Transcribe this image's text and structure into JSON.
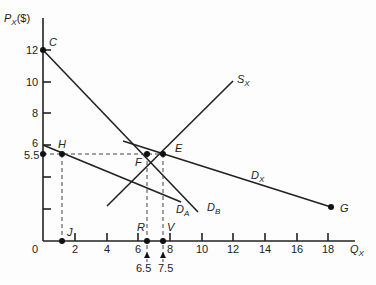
{
  "diagram": {
    "type": "supply-demand",
    "y_axis": {
      "label": "P",
      "label_sub": "X",
      "label_unit": "($)",
      "ticks": [
        "12",
        "10",
        "8",
        "6",
        "5.5"
      ]
    },
    "x_axis": {
      "label": "Q",
      "label_sub": "X",
      "ticks": [
        "0",
        "2",
        "4",
        "6",
        "8",
        "10",
        "12",
        "14",
        "16",
        "18"
      ],
      "extra_ticks": [
        "6.5",
        "7.5"
      ]
    },
    "points": {
      "C": "C",
      "H": "H",
      "E": "E",
      "F": "F",
      "G": "G",
      "J": "J",
      "R": "R",
      "V": "V"
    },
    "curves": {
      "sx": {
        "label": "S",
        "sub": "X"
      },
      "dx": {
        "label": "D",
        "sub": "X"
      },
      "da": {
        "label": "D",
        "sub": "A"
      },
      "db": {
        "label": "D",
        "sub": "B"
      }
    }
  }
}
